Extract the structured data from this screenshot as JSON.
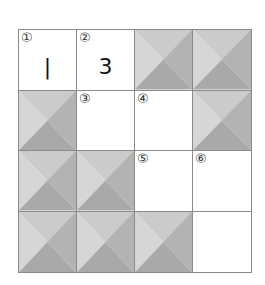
{
  "puzzle": {
    "rows": 4,
    "cols": 4,
    "colors": {
      "border": "#8a8a8a",
      "blank": "#ffffff",
      "shade_top": "#cbcbcb",
      "shade_left": "#d6d6d6",
      "shade_right": "#b3b3b3",
      "shade_bottom": "#a9a9a9"
    },
    "cells": [
      {
        "r": 0,
        "c": 0,
        "type": "open",
        "number": "①",
        "value": "|"
      },
      {
        "r": 0,
        "c": 1,
        "type": "open",
        "number": "②",
        "value": "3"
      },
      {
        "r": 0,
        "c": 2,
        "type": "shaded",
        "number": "",
        "value": ""
      },
      {
        "r": 0,
        "c": 3,
        "type": "shaded",
        "number": "",
        "value": ""
      },
      {
        "r": 1,
        "c": 0,
        "type": "shaded",
        "number": "",
        "value": ""
      },
      {
        "r": 1,
        "c": 1,
        "type": "open",
        "number": "③",
        "value": ""
      },
      {
        "r": 1,
        "c": 2,
        "type": "open",
        "number": "④",
        "value": ""
      },
      {
        "r": 1,
        "c": 3,
        "type": "shaded",
        "number": "",
        "value": ""
      },
      {
        "r": 2,
        "c": 0,
        "type": "shaded",
        "number": "",
        "value": ""
      },
      {
        "r": 2,
        "c": 1,
        "type": "shaded",
        "number": "",
        "value": ""
      },
      {
        "r": 2,
        "c": 2,
        "type": "open",
        "number": "⑤",
        "value": ""
      },
      {
        "r": 2,
        "c": 3,
        "type": "open",
        "number": "⑥",
        "value": ""
      },
      {
        "r": 3,
        "c": 0,
        "type": "shaded",
        "number": "",
        "value": ""
      },
      {
        "r": 3,
        "c": 1,
        "type": "shaded",
        "number": "",
        "value": ""
      },
      {
        "r": 3,
        "c": 2,
        "type": "shaded",
        "number": "",
        "value": ""
      },
      {
        "r": 3,
        "c": 3,
        "type": "open",
        "number": "",
        "value": ""
      }
    ]
  }
}
